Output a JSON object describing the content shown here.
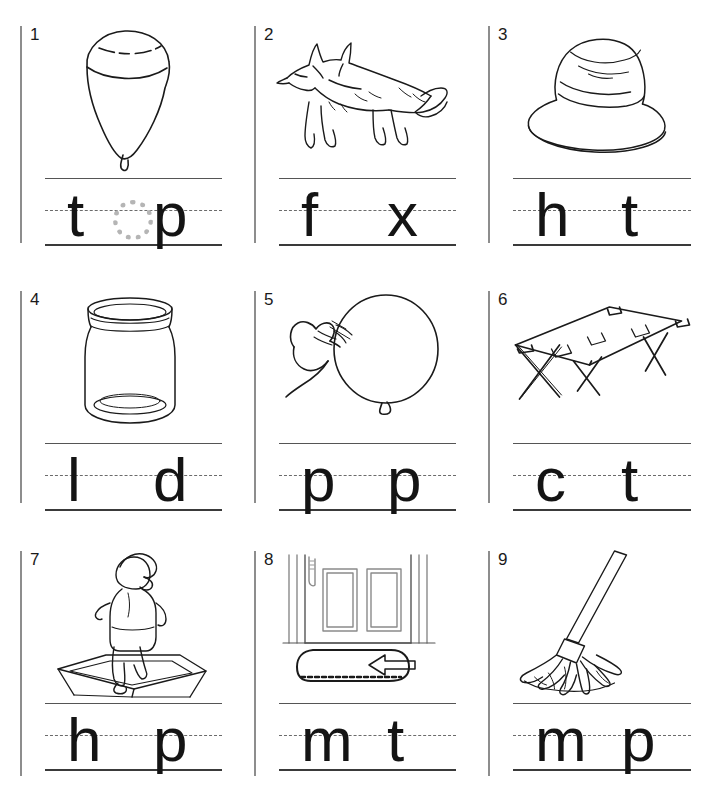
{
  "worksheet": {
    "title": "Short vowel picture-word worksheet",
    "grid": {
      "columns": 3,
      "rows": 3
    },
    "ink_color": "#141414",
    "line_color": "#555555",
    "trace_color": "#b5b5b5"
  },
  "items": [
    {
      "number": "1",
      "picture": "spinning-top",
      "picture_label": "top",
      "answer_word": "top",
      "letters": {
        "first": "t",
        "middle": "o",
        "third": "p"
      },
      "middle_style": "traced-dotted"
    },
    {
      "number": "2",
      "picture": "fox",
      "picture_label": "fox",
      "answer_word": "fox",
      "letters": {
        "first": "f",
        "middle": "",
        "third": "x"
      },
      "middle_style": "blank"
    },
    {
      "number": "3",
      "picture": "hat",
      "picture_label": "hat",
      "answer_word": "hat",
      "letters": {
        "first": "h",
        "middle": "",
        "third": "t"
      },
      "middle_style": "blank"
    },
    {
      "number": "4",
      "picture": "jar-lid",
      "picture_label": "lid",
      "answer_word": "lid",
      "letters": {
        "first": "l",
        "middle": "",
        "third": "d"
      },
      "middle_style": "blank"
    },
    {
      "number": "5",
      "picture": "hand-popping-balloon",
      "picture_label": "pop",
      "answer_word": "pop",
      "letters": {
        "first": "p",
        "middle": "",
        "third": "p"
      },
      "middle_style": "blank"
    },
    {
      "number": "6",
      "picture": "folding-cot",
      "picture_label": "cot",
      "answer_word": "cot",
      "letters": {
        "first": "c",
        "middle": "",
        "third": "t"
      },
      "middle_style": "blank"
    },
    {
      "number": "7",
      "picture": "child-hopping",
      "picture_label": "hop",
      "answer_word": "hop",
      "letters": {
        "first": "h",
        "middle": "",
        "third": "p"
      },
      "middle_style": "blank"
    },
    {
      "number": "8",
      "picture": "door-mat-with-arrow",
      "picture_label": "mat",
      "answer_word": "mat",
      "letters": {
        "first": "m",
        "middle": "",
        "third": "t"
      },
      "middle_style": "blank"
    },
    {
      "number": "9",
      "picture": "mop",
      "picture_label": "mop",
      "answer_word": "mop",
      "letters": {
        "first": "m",
        "middle": "",
        "third": "p"
      },
      "middle_style": "blank"
    }
  ]
}
